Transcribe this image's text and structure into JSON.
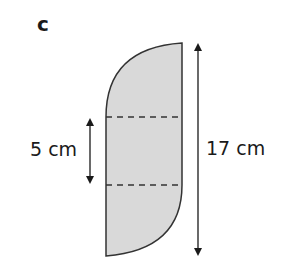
{
  "figure": {
    "label": "c"
  },
  "shape": {
    "fill_color": "#d9d9d9",
    "stroke_color": "#333333",
    "description": "vertical rectangle with quarter-circle arcs on top-left and bottom-right corners"
  },
  "dimensions": {
    "middle_height": {
      "value": "5 cm"
    },
    "total_height": {
      "value": "17 cm"
    }
  }
}
